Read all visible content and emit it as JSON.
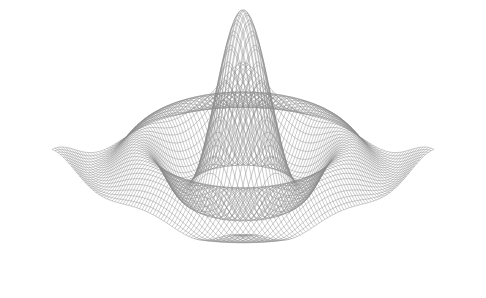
{
  "chart_data": {
    "type": "surface-wireframe",
    "title": "",
    "xlabel": "",
    "ylabel": "",
    "zlabel": "",
    "function": "z = sin(r)/r (sinc radial ripple)",
    "grid": false,
    "axes_visible": false,
    "x_range": [
      -10,
      10
    ],
    "y_range": [
      -10,
      10
    ],
    "mesh_resolution": 70,
    "line_color": "#8a8a8a",
    "background": "#ffffff",
    "view": {
      "elevation_deg": 28,
      "azimuth_deg": 45
    }
  }
}
